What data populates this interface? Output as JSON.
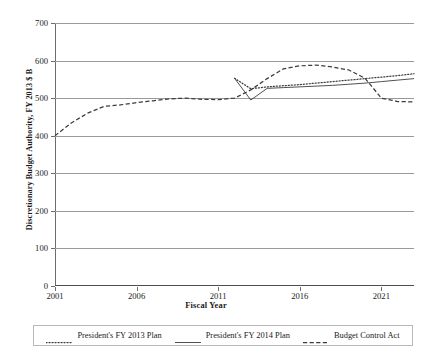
{
  "chart_data": {
    "type": "line",
    "title": "",
    "xlabel": "Fiscal Year",
    "ylabel": "Discretionary Budget Authority, FY 2013 $ B",
    "xlim": [
      2001,
      2023
    ],
    "ylim": [
      0,
      700
    ],
    "yticks": [
      0,
      100,
      200,
      300,
      400,
      500,
      600,
      700
    ],
    "xticks": [
      2001,
      2006,
      2011,
      2016,
      2021
    ],
    "grid": true,
    "legend_position": "bottom",
    "x": [
      2001,
      2002,
      2003,
      2004,
      2005,
      2006,
      2007,
      2008,
      2009,
      2010,
      2011,
      2012,
      2013,
      2014,
      2015,
      2016,
      2017,
      2018,
      2019,
      2020,
      2021,
      2022,
      2023
    ],
    "series": [
      {
        "name": "President's FY 2013 Plan",
        "style": "dotted",
        "values": [
          null,
          null,
          null,
          null,
          null,
          null,
          null,
          null,
          null,
          null,
          null,
          553,
          525,
          530,
          533,
          536,
          540,
          544,
          548,
          552,
          556,
          560,
          565
        ]
      },
      {
        "name": "President's FY 2014 Plan",
        "style": "solid",
        "values": [
          null,
          null,
          null,
          null,
          null,
          null,
          null,
          null,
          null,
          null,
          null,
          553,
          495,
          526,
          528,
          530,
          532,
          534,
          537,
          540,
          544,
          548,
          552
        ]
      },
      {
        "name": "Budget Control Act",
        "style": "dashed",
        "values": [
          400,
          434,
          460,
          478,
          482,
          488,
          493,
          498,
          500,
          497,
          496,
          500,
          522,
          552,
          578,
          586,
          588,
          583,
          575,
          553,
          500,
          491,
          490
        ]
      }
    ],
    "series_historical": {
      "name": "Historical",
      "comment_x": [
        2001,
        2002,
        2003,
        2004,
        2005,
        2006,
        2007,
        2008,
        2009,
        2010,
        2011,
        2012
      ],
      "comment_values": [
        400,
        434,
        460,
        478,
        482,
        488,
        493,
        498,
        500,
        497,
        496,
        500
      ]
    }
  },
  "legend": {
    "items": [
      {
        "label": "President's FY 2013 Plan",
        "style": "dotted"
      },
      {
        "label": "President's FY 2014 Plan",
        "style": "solid"
      },
      {
        "label": "Budget Control Act",
        "style": "dashed"
      }
    ]
  },
  "axis": {
    "y_title": "Discretionary Budget Authority, FY 2013 $ B",
    "x_title": "Fiscal Year"
  }
}
